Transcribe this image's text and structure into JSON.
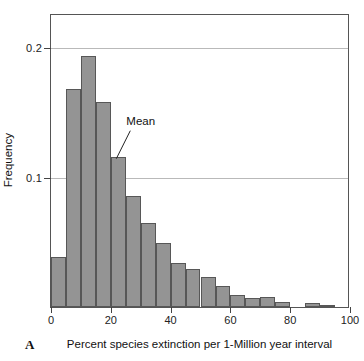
{
  "figure": {
    "panel_letter": "A",
    "xlabel": "Percent species extinction per 1-Million year interval",
    "ylabel": "Frequency",
    "mean_annotation": "Mean"
  },
  "chart_data": {
    "type": "bar",
    "title": "",
    "subtitle": "",
    "xlabel": "Percent species extinction per 1-Million year interval",
    "ylabel": "Frequency",
    "panel_label": "A",
    "grid": true,
    "legend": "none",
    "xlim": [
      0,
      100
    ],
    "ylim": [
      0,
      0.225
    ],
    "bin_width": 5,
    "xticks": [
      0,
      20,
      40,
      60,
      80,
      100
    ],
    "xtick_labels": [
      "0",
      "20",
      "40",
      "60",
      "80",
      "100"
    ],
    "yticks": [
      0.1,
      0.2
    ],
    "ytick_labels": [
      "0.1",
      "0.2"
    ],
    "categories": [
      "0-5",
      "5-10",
      "10-15",
      "15-20",
      "20-25",
      "25-30",
      "30-35",
      "35-40",
      "40-45",
      "45-50",
      "50-55",
      "55-60",
      "60-65",
      "65-70",
      "70-75",
      "75-80",
      "80-85",
      "85-90",
      "90-95",
      "95-100"
    ],
    "bin_starts": [
      0,
      5,
      10,
      15,
      20,
      25,
      30,
      35,
      40,
      45,
      50,
      55,
      60,
      65,
      70,
      75,
      80,
      85,
      90,
      95
    ],
    "values": [
      0.038,
      0.167,
      0.192,
      0.157,
      0.115,
      0.085,
      0.064,
      0.049,
      0.034,
      0.029,
      0.023,
      0.016,
      0.009,
      0.007,
      0.008,
      0.004,
      0.0,
      0.003,
      0.001,
      0.0
    ],
    "annotations": [
      {
        "text": "Mean",
        "points_to_bin": "20-25",
        "x": 22.5,
        "y": 0.115
      }
    ]
  }
}
